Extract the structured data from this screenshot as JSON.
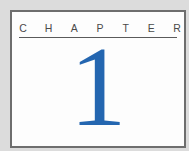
{
  "chapter": {
    "label_letters": [
      "C",
      "H",
      "A",
      "P",
      "T",
      "E",
      "R"
    ],
    "label": "CHAPTER",
    "number": "1"
  },
  "colors": {
    "background": "#dcdcdc",
    "frame_fill": "#fdfdfd",
    "frame_border": "#6e6e6e",
    "label_text": "#4a4a4a",
    "number": "#2466b0"
  }
}
